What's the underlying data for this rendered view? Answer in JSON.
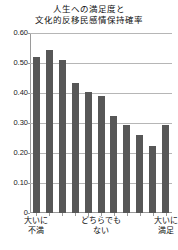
{
  "chart_data": {
    "type": "bar",
    "title_lines": [
      "人生への満足度と",
      "文化的反移民感情保持確率"
    ],
    "xlabel": "",
    "ylabel": "",
    "ylim": [
      0,
      0.6
    ],
    "grid": true,
    "legend": "none",
    "categories": [
      "1",
      "2",
      "3",
      "4",
      "5",
      "6",
      "7",
      "8",
      "9",
      "10",
      "11"
    ],
    "values": [
      0.52,
      0.545,
      0.51,
      0.435,
      0.405,
      0.39,
      0.325,
      0.295,
      0.26,
      0.225,
      0.295
    ],
    "ytick_labels": [
      "0.60",
      "0.50",
      "0.40",
      "0.30",
      "0.20",
      "0.10",
      "0"
    ],
    "ytick_values": [
      0.6,
      0.5,
      0.4,
      0.3,
      0.2,
      0.1,
      0
    ],
    "xaxis_group_labels": [
      {
        "lines": [
          "大いに",
          "不満"
        ],
        "position": "left"
      },
      {
        "lines": [
          "どちらでも",
          "ない"
        ],
        "position": "center"
      },
      {
        "lines": [
          "大いに",
          "満足"
        ],
        "position": "right"
      }
    ],
    "colors": {
      "bar": "#575757",
      "grid": "#b6b6b6",
      "axis": "#9a9a9a",
      "text": "#111111",
      "background": "#ffffff"
    }
  }
}
